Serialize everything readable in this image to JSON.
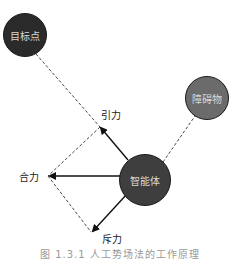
{
  "diagram": {
    "nodes": {
      "target": {
        "label": "目标点",
        "color": "#2a2a2a"
      },
      "obstacle": {
        "label": "障碍物",
        "color": "#6b6b6b"
      },
      "agent": {
        "label": "智能体",
        "color": "#3e3e3e"
      }
    },
    "forces": {
      "attraction": "引力",
      "resultant": "合力",
      "repulsion": "斥力"
    },
    "caption": "图 1.3.1 人工势场法的工作原理"
  }
}
